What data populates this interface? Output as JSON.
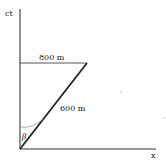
{
  "diagram": {
    "axes": {
      "vertical_label": "ct",
      "horizontal_label": "x"
    },
    "segments": {
      "horizontal_length_label": "800 m",
      "diagonal_length_label": "600 m"
    },
    "angle_label": "β",
    "colors": {
      "line": "#222222",
      "arc": "#888888",
      "background": "#ffffff"
    }
  }
}
